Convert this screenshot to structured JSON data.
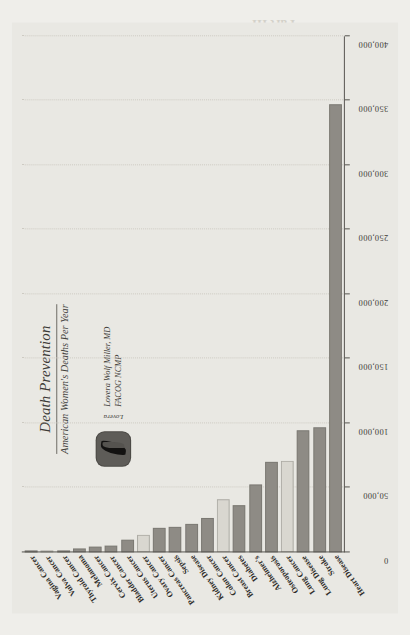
{
  "document": {
    "bleed_text": [
      "Part III",
      "These Killer Diseases are Part To Identify",
      "American women live ... can do to avoid them",
      "Part IV",
      "Healthier and Really Prevention"
    ]
  },
  "figure": {
    "title": "Death Prevention",
    "subtitle": "American Women's Deaths Per Year",
    "author": {
      "script_mark": "Lovera",
      "name_line1": "Lovera Wolf Miller, MD",
      "name_line2": "FACOG NCMP",
      "logo_icon": "swoosh-logo"
    }
  },
  "colors": {
    "page_background": "#efeeea",
    "figure_background": "#e9e8e3",
    "bar_dark": "#8e8b85",
    "bar_light": "#d9d7d0",
    "axis": "#55534e",
    "gridline": "#cdcac2"
  },
  "chart_data": {
    "type": "bar",
    "orientation": "horizontal",
    "title": "Death Prevention",
    "subtitle": "American Women's Deaths Per Year",
    "xlabel": "",
    "ylabel": "",
    "xlim": [
      0,
      400000
    ],
    "xticks": [
      0,
      50000,
      100000,
      150000,
      200000,
      250000,
      300000,
      350000,
      400000
    ],
    "xtick_labels": [
      "0",
      "50,000",
      "100,000",
      "150,000",
      "200,000",
      "250,000",
      "300,000",
      "350,000",
      "400,000"
    ],
    "grid": true,
    "legend": "none",
    "categories": [
      "Heart Disease",
      "Stroke",
      "Lung Disease",
      "Lung Cancer",
      "Osteoporosis",
      "Alzheimer's",
      "Diabetes",
      "Breast Cancer",
      "Colon Cancer",
      "Kidney Disease",
      "Sepsis",
      "Pancreas Cancer",
      "Ovary Cancer",
      "Uterus Cancer",
      "Bladder Cancer",
      "Cervix Cancer",
      "Melanoma",
      "Thyroid Cancer",
      "Vulva Cancer",
      "Vagina Cancer"
    ],
    "values": [
      347000,
      97000,
      95000,
      71000,
      70000,
      53000,
      37000,
      41000,
      27000,
      22000,
      20000,
      19000,
      14000,
      10000,
      5000,
      4200,
      3300,
      1200,
      1000,
      700
    ],
    "bar_styles": [
      "dark",
      "dark",
      "dark",
      "light",
      "dark",
      "dark",
      "dark",
      "light",
      "dark",
      "dark",
      "dark",
      "dark",
      "light",
      "dark",
      "dark",
      "dark",
      "dark",
      "dark",
      "light",
      "dark"
    ]
  }
}
